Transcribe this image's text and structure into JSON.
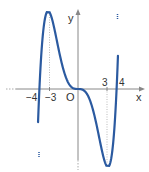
{
  "chart_data": {
    "type": "line",
    "title": "",
    "xlabel": "x",
    "ylabel": "y",
    "origin_label": "O",
    "x_tick_labels": [
      "-4",
      "-3",
      "3",
      "4"
    ],
    "x_ticks": [
      -4,
      -3,
      3,
      4
    ],
    "critical_points": [
      {
        "x": -3,
        "kind": "local maximum"
      },
      {
        "x": 0,
        "kind": "stationary inflection",
        "y": 0
      },
      {
        "x": 3,
        "kind": "local minimum"
      }
    ],
    "zeros": [
      -4,
      0,
      4
    ],
    "series": [
      {
        "name": "f(x)",
        "color": "#2b5aa0",
        "x": [
          -4.15,
          -4,
          -3.5,
          -3,
          -2.5,
          -2,
          -1.5,
          -1,
          -0.5,
          0,
          0.5,
          1,
          1.5,
          2,
          2.5,
          3,
          3.5,
          4,
          4.15
        ],
        "shape": "odd quintic-like curve: rises from below at x≈-4, peak at x=-3, flat at origin, trough at x=3, rises through x=4"
      }
    ],
    "grid": false,
    "guide_lines": "dotted vertical lines at x=-3 and x=3"
  },
  "labels": {
    "x_axis": "x",
    "y_axis": "y",
    "origin": "O",
    "tick_m4": "−4",
    "tick_m3": "−3",
    "tick_3": "3",
    "tick_4": "4"
  },
  "colors": {
    "curve": "#2b5aa0",
    "axis": "#888888",
    "text": "#333333"
  }
}
